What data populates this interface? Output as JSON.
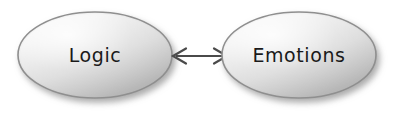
{
  "diagram": {
    "background_color": "#ffffff",
    "nodes": [
      {
        "id": "logic",
        "label": "Logic",
        "shape": "ellipse",
        "cx": 95,
        "cy": 55,
        "rx": 77,
        "ry": 43,
        "fill_light": "#f5f5f5",
        "fill_dark": "#b4b4b4",
        "border_color": "#8c8c8c",
        "text_color": "#1a1a1a"
      },
      {
        "id": "emotions",
        "label": "Emotions",
        "shape": "ellipse",
        "cx": 299,
        "cy": 55,
        "rx": 77,
        "ry": 43,
        "fill_light": "#f5f5f5",
        "fill_dark": "#b4b4b4",
        "border_color": "#8c8c8c",
        "text_color": "#1a1a1a"
      }
    ],
    "connectors": [
      {
        "id": "logic-emotions-link",
        "type": "double-headed-arrow",
        "from": "logic",
        "to": "emotions",
        "x1": 172,
        "x2": 228,
        "y": 56,
        "color": "#4a4a4a",
        "stroke_width": 2,
        "arrowhead_style": "open-barb",
        "label": ""
      }
    ],
    "shadow": {
      "color": "#a8a8a8",
      "offset_x": 3,
      "offset_y": 4,
      "blur": 5
    }
  }
}
